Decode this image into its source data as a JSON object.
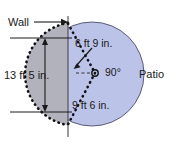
{
  "figure": {
    "labels": {
      "wall": "Wall",
      "patio": "Patio",
      "wall_height": "13 ft 5 in.",
      "chord_top": "6 ft 9 in.",
      "chord_bottom": "9 ft 6 in.",
      "angle": "90°"
    },
    "colors": {
      "patio_fill": "#bcc3e8",
      "segment_fill": "#b2b2bd",
      "outline": "#5a5a7a",
      "line": "#1a1a1a",
      "background": "#ffffff"
    },
    "geometry": {
      "circle_center_x": 92,
      "circle_center_y": 74,
      "circle_radius": 52,
      "wall_x": 68,
      "dimension_top_y": 38,
      "dimension_bottom_y": 112,
      "vertex_x": 95,
      "vertex_y": 73
    }
  }
}
